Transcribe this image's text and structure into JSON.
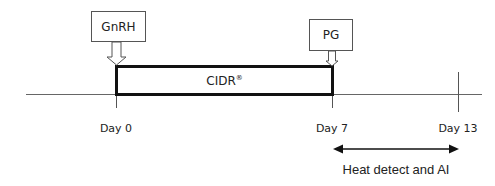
{
  "diagram": {
    "type": "timeline",
    "treatments": [
      {
        "label": "GnRH",
        "day": 0
      },
      {
        "label": "PG",
        "day": 7
      }
    ],
    "device": {
      "label": "CIDR",
      "mark": "®",
      "start_day": 0,
      "end_day": 7
    },
    "days": [
      {
        "label": "Day 0",
        "value": 0
      },
      {
        "label": "Day 7",
        "value": 7
      },
      {
        "label": "Day 13",
        "value": 13
      }
    ],
    "interval": {
      "label": "Heat detect and AI",
      "start_day": 7,
      "end_day": 13
    }
  }
}
